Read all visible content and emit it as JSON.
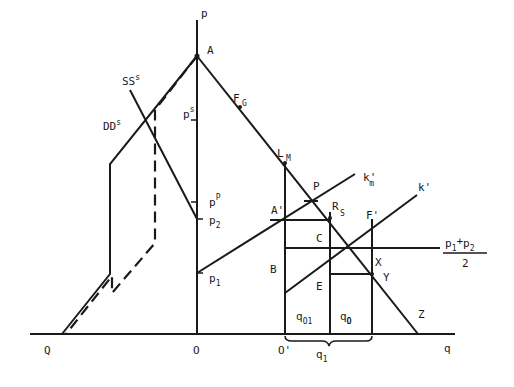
{
  "diagram": {
    "type": "economic supply-demand diagram",
    "axes": {
      "vertical_label": "p",
      "horizontal_label": "q",
      "origin_label": "O",
      "second_origin_label": "O'",
      "left_label": "Q"
    },
    "curves": {
      "supply_left": "SS",
      "supply_left_sup": "s",
      "demand_left": "DD",
      "demand_left_sup": "s",
      "k_m": "k",
      "k_m_sub": "m",
      "k_m_prime": "'",
      "k": "k'"
    },
    "price_labels": {
      "ps": "p",
      "ps_sup": "s",
      "pP": "p",
      "pP_sup": "P",
      "p2": "p",
      "p2_sub": "2",
      "p1": "p",
      "p1_sub": "1",
      "avg_num_a": "p",
      "avg_num_a_sub": "1",
      "avg_plus": "+",
      "avg_num_b": "p",
      "avg_num_b_sub": "2",
      "avg_den": "2"
    },
    "points": {
      "A": "A",
      "F": "F",
      "G": "G",
      "L": "L",
      "M": "M",
      "P": "P",
      "A_prime": "A'",
      "R": "R",
      "S": "S",
      "F_prime": "F'",
      "C": "C",
      "B": "B",
      "E": "E",
      "X": "X",
      "Y": "Y",
      "Z": "Z"
    },
    "quantity_labels": {
      "q01": "q",
      "q01_sub": "O1",
      "q0": "q",
      "q0_sub": "O",
      "q1": "q",
      "q1_sub": "1"
    }
  }
}
